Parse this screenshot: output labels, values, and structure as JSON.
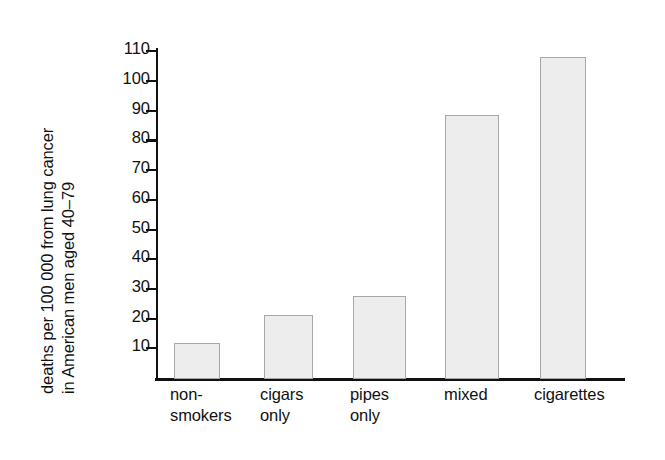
{
  "chart_data": {
    "type": "bar",
    "title": "",
    "xlabel": "",
    "ylabel": "deaths per 100 000 from lung cancer in American men aged 40–79",
    "ylabel_lines": [
      "deaths per 100 000 from lung cancer",
      "in American men aged 40–79"
    ],
    "categories": [
      "non-smokers",
      "cigars only",
      "pipes only",
      "mixed",
      "cigarettes"
    ],
    "category_label_lines": [
      [
        "non-",
        "smokers"
      ],
      [
        "cigars",
        "only"
      ],
      [
        "pipes",
        "only"
      ],
      [
        "mixed"
      ],
      [
        "cigarettes"
      ]
    ],
    "values": [
      12,
      21.5,
      28,
      89,
      108.5
    ],
    "ylim": [
      0,
      116
    ],
    "yticks": [
      10,
      20,
      30,
      40,
      50,
      60,
      70,
      80,
      90,
      100,
      110
    ],
    "ytick_labels": [
      "10",
      "20",
      "30",
      "40",
      "50",
      "60",
      "70",
      "80",
      "90",
      "100",
      "110"
    ],
    "grid": false,
    "legend": null,
    "bar_fill_color": "#ededed",
    "bar_border_color": "#a8a8a8",
    "axis_color": "#111111",
    "background_color": "#ffffff"
  }
}
